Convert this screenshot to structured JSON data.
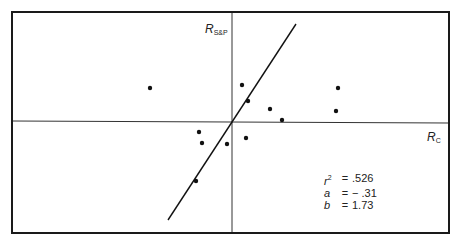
{
  "chart_data": {
    "type": "scatter",
    "title": "",
    "xlabel": "R_C",
    "ylabel": "R_S&P",
    "axes": {
      "x_label_main": "R",
      "x_label_sub": "C",
      "y_label_main": "R",
      "y_label_sub": "S&P"
    },
    "grid": false,
    "legend": null,
    "points_px": [
      {
        "x": 150,
        "y": 88
      },
      {
        "x": 242,
        "y": 85
      },
      {
        "x": 248,
        "y": 101
      },
      {
        "x": 270,
        "y": 109
      },
      {
        "x": 282,
        "y": 120
      },
      {
        "x": 338,
        "y": 88
      },
      {
        "x": 336,
        "y": 111
      },
      {
        "x": 199,
        "y": 132
      },
      {
        "x": 202,
        "y": 143
      },
      {
        "x": 227,
        "y": 144
      },
      {
        "x": 246,
        "y": 138
      },
      {
        "x": 196,
        "y": 181
      }
    ],
    "regression_line_px": {
      "x1": 168,
      "y1": 220,
      "x2": 296,
      "y2": 24
    },
    "origin_px": {
      "x": 232,
      "y": 121
    },
    "frame_px": {
      "x": 12,
      "y": 12,
      "w": 437,
      "h": 221
    },
    "annotations": {
      "r2": ".526",
      "a": "− .31",
      "b": "1.73"
    }
  },
  "stats": {
    "r2_key": "r",
    "r2_sup": "2",
    "r2_value": ".526",
    "a_key": "a",
    "a_value": "− .31",
    "b_key": "b",
    "b_value": "1.73",
    "eq": "="
  },
  "labels": {
    "y_main": "R",
    "y_sub": "S&P",
    "x_main": "R",
    "x_sub": "C"
  }
}
